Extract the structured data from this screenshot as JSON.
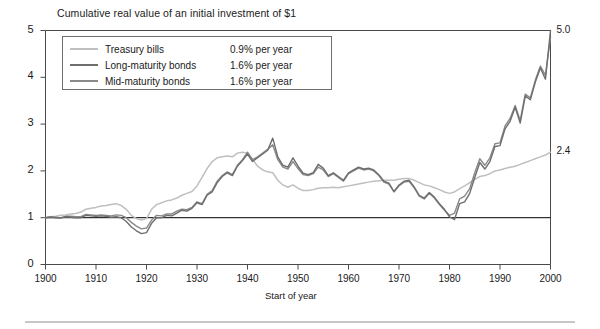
{
  "chart_data": {
    "type": "line",
    "title": "Cumulative real value of an initial investment of $1",
    "xlabel": "Start of year",
    "ylabel": "",
    "xlim": [
      1900,
      2000
    ],
    "ylim": [
      0,
      5
    ],
    "grid": false,
    "legend_position": "top-left",
    "xticks": [
      1900,
      1910,
      1920,
      1930,
      1940,
      1950,
      1960,
      1970,
      1980,
      1990,
      2000
    ],
    "yticks": [
      0,
      1,
      2,
      3,
      4,
      5
    ],
    "reference_line": {
      "y": 1,
      "color": "#000000"
    },
    "end_labels": [
      {
        "text": "5.0",
        "series": "Long-maturity bonds",
        "value": 5.0
      },
      {
        "text": "2.4",
        "series": "Treasury bills",
        "value": 2.4
      }
    ],
    "x": [
      1900,
      1901,
      1902,
      1903,
      1904,
      1905,
      1906,
      1907,
      1908,
      1909,
      1910,
      1911,
      1912,
      1913,
      1914,
      1915,
      1916,
      1917,
      1918,
      1919,
      1920,
      1921,
      1922,
      1923,
      1924,
      1925,
      1926,
      1927,
      1928,
      1929,
      1930,
      1931,
      1932,
      1933,
      1934,
      1935,
      1936,
      1937,
      1938,
      1939,
      1940,
      1941,
      1942,
      1943,
      1944,
      1945,
      1946,
      1947,
      1948,
      1949,
      1950,
      1951,
      1952,
      1953,
      1954,
      1955,
      1956,
      1957,
      1958,
      1959,
      1960,
      1961,
      1962,
      1963,
      1964,
      1965,
      1966,
      1967,
      1968,
      1969,
      1970,
      1971,
      1972,
      1973,
      1974,
      1975,
      1976,
      1977,
      1978,
      1979,
      1980,
      1981,
      1982,
      1983,
      1984,
      1985,
      1986,
      1987,
      1988,
      1989,
      1990,
      1991,
      1992,
      1993,
      1994,
      1995,
      1996,
      1997,
      1998,
      1999,
      2000
    ],
    "series": [
      {
        "name": "Treasury bills",
        "rate_label": "0.9% per year",
        "annual_rate_pct": 0.9,
        "color": "#bfbfbf",
        "final_value": 2.4,
        "values": [
          1.0,
          1.02,
          1.03,
          1.05,
          1.06,
          1.08,
          1.09,
          1.12,
          1.18,
          1.2,
          1.22,
          1.25,
          1.26,
          1.28,
          1.3,
          1.26,
          1.18,
          1.05,
          0.98,
          0.95,
          0.98,
          1.18,
          1.28,
          1.32,
          1.36,
          1.38,
          1.42,
          1.48,
          1.52,
          1.56,
          1.68,
          1.86,
          2.05,
          2.2,
          2.28,
          2.3,
          2.32,
          2.3,
          2.38,
          2.4,
          2.38,
          2.25,
          2.1,
          2.02,
          1.98,
          1.96,
          1.8,
          1.7,
          1.65,
          1.7,
          1.63,
          1.58,
          1.58,
          1.6,
          1.63,
          1.64,
          1.64,
          1.65,
          1.64,
          1.66,
          1.68,
          1.7,
          1.72,
          1.74,
          1.76,
          1.78,
          1.79,
          1.8,
          1.8,
          1.8,
          1.82,
          1.84,
          1.84,
          1.8,
          1.75,
          1.7,
          1.68,
          1.64,
          1.6,
          1.55,
          1.52,
          1.55,
          1.62,
          1.68,
          1.75,
          1.82,
          1.88,
          1.9,
          1.94,
          2.0,
          2.02,
          2.05,
          2.08,
          2.1,
          2.14,
          2.18,
          2.22,
          2.26,
          2.3,
          2.34,
          2.4
        ]
      },
      {
        "name": "Long-maturity bonds",
        "rate_label": "1.6% per year",
        "annual_rate_pct": 1.6,
        "color": "#6e6e6e",
        "final_value": 5.0,
        "values": [
          1.0,
          1.01,
          1.0,
          0.99,
          1.02,
          1.01,
          1.0,
          1.0,
          1.05,
          1.04,
          1.03,
          1.04,
          1.03,
          1.01,
          1.02,
          1.0,
          0.92,
          0.8,
          0.72,
          0.66,
          0.68,
          0.88,
          1.0,
          1.0,
          1.05,
          1.04,
          1.1,
          1.16,
          1.14,
          1.2,
          1.32,
          1.28,
          1.48,
          1.55,
          1.75,
          1.88,
          1.96,
          1.9,
          2.1,
          2.22,
          2.36,
          2.2,
          2.28,
          2.36,
          2.44,
          2.7,
          2.3,
          2.12,
          2.08,
          2.28,
          2.1,
          1.95,
          1.92,
          1.96,
          2.14,
          2.06,
          1.9,
          1.96,
          1.88,
          1.8,
          1.96,
          2.02,
          2.08,
          2.04,
          2.06,
          2.02,
          1.92,
          1.78,
          1.74,
          1.56,
          1.7,
          1.78,
          1.8,
          1.66,
          1.48,
          1.42,
          1.54,
          1.44,
          1.3,
          1.18,
          1.02,
          0.96,
          1.3,
          1.34,
          1.52,
          1.86,
          2.18,
          2.04,
          2.2,
          2.52,
          2.54,
          2.9,
          3.06,
          3.36,
          3.02,
          3.6,
          3.52,
          3.9,
          4.2,
          3.96,
          5.0
        ]
      },
      {
        "name": "Mid-maturity bonds",
        "rate_label": "1.6% per year",
        "annual_rate_pct": 1.6,
        "color": "#8a8a8a",
        "final_value": 4.85,
        "values": [
          1.0,
          1.02,
          1.01,
          1.0,
          1.03,
          1.03,
          1.02,
          1.02,
          1.07,
          1.06,
          1.05,
          1.06,
          1.05,
          1.04,
          1.06,
          1.05,
          1.0,
          0.9,
          0.82,
          0.76,
          0.78,
          0.95,
          1.05,
          1.04,
          1.08,
          1.08,
          1.14,
          1.18,
          1.17,
          1.22,
          1.34,
          1.3,
          1.5,
          1.58,
          1.78,
          1.9,
          1.98,
          1.92,
          2.12,
          2.24,
          2.4,
          2.24,
          2.3,
          2.38,
          2.46,
          2.56,
          2.24,
          2.08,
          2.04,
          2.2,
          2.05,
          1.92,
          1.9,
          1.94,
          2.08,
          2.02,
          1.88,
          1.94,
          1.86,
          1.78,
          1.94,
          2.0,
          2.06,
          2.02,
          2.04,
          2.0,
          1.9,
          1.76,
          1.72,
          1.55,
          1.68,
          1.76,
          1.78,
          1.64,
          1.46,
          1.4,
          1.52,
          1.42,
          1.28,
          1.16,
          1.05,
          1.1,
          1.4,
          1.46,
          1.62,
          1.96,
          2.26,
          2.12,
          2.28,
          2.58,
          2.6,
          2.96,
          3.12,
          3.4,
          3.08,
          3.64,
          3.56,
          3.94,
          4.24,
          4.04,
          4.85
        ]
      }
    ]
  }
}
